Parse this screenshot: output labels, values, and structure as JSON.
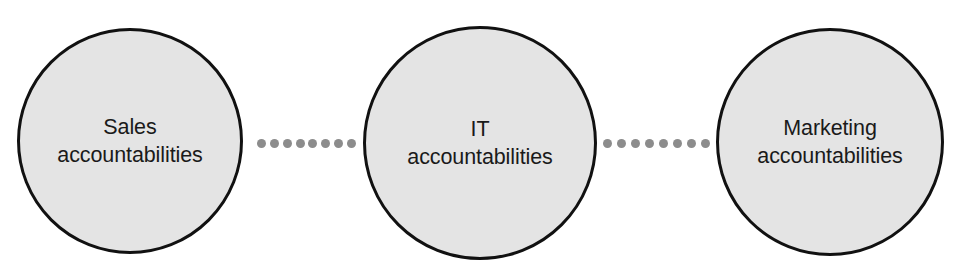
{
  "diagram": {
    "type": "linked-circles-flow",
    "background_color": "#ffffff",
    "node_fill_color": "#e4e4e4",
    "node_stroke_color": "#111111",
    "connector_dot_color": "#8c8c8c",
    "text_color": "#1a1a1a",
    "nodes": [
      {
        "id": "sales",
        "label": "Sales\naccountabilities",
        "line1": "Sales",
        "line2": "accountabilities"
      },
      {
        "id": "it",
        "label": "IT\naccountabilities",
        "line1": "IT",
        "line2": "accountabilities"
      },
      {
        "id": "marketing",
        "label": "Marketing\naccountabilities",
        "line1": "Marketing",
        "line2": "accountabilities"
      }
    ],
    "connectors": [
      {
        "id": "sales-it",
        "from": "sales",
        "to": "it",
        "style": "dotted",
        "dot_count": 8
      },
      {
        "id": "it-marketing",
        "from": "it",
        "to": "marketing",
        "style": "dotted",
        "dot_count": 8
      }
    ]
  }
}
